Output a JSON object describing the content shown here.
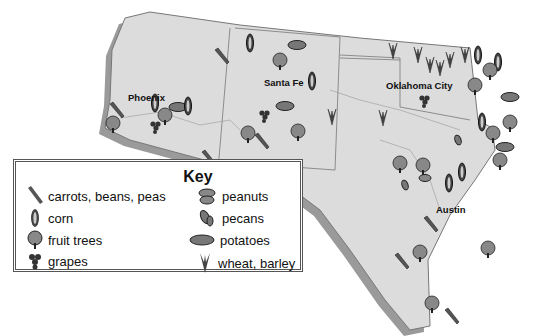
{
  "map": {
    "region": "Southwest United States",
    "cities": [
      {
        "name": "Phoenix",
        "x": 128,
        "y": 92
      },
      {
        "name": "Santa Fe",
        "x": 264,
        "y": 77
      },
      {
        "name": "Oklahoma City",
        "x": 386,
        "y": 80
      },
      {
        "name": "Austin",
        "x": 436,
        "y": 204
      }
    ],
    "colors": {
      "land": "#dcdcdc",
      "border": "#777777",
      "shadow": "#9a9a9a",
      "icon": "#333333"
    }
  },
  "key": {
    "title": "Key",
    "items": [
      {
        "icon": "carrot-icon",
        "label": "carrots, beans, peas"
      },
      {
        "icon": "corn-icon",
        "label": "corn"
      },
      {
        "icon": "fruit-tree-icon",
        "label": "fruit trees"
      },
      {
        "icon": "grapes-icon",
        "label": "grapes"
      },
      {
        "icon": "peanut-icon",
        "label": "peanuts"
      },
      {
        "icon": "pecan-icon",
        "label": "pecans"
      },
      {
        "icon": "potato-icon",
        "label": "potatoes"
      },
      {
        "icon": "wheat-icon",
        "label": "wheat, barley"
      }
    ]
  }
}
